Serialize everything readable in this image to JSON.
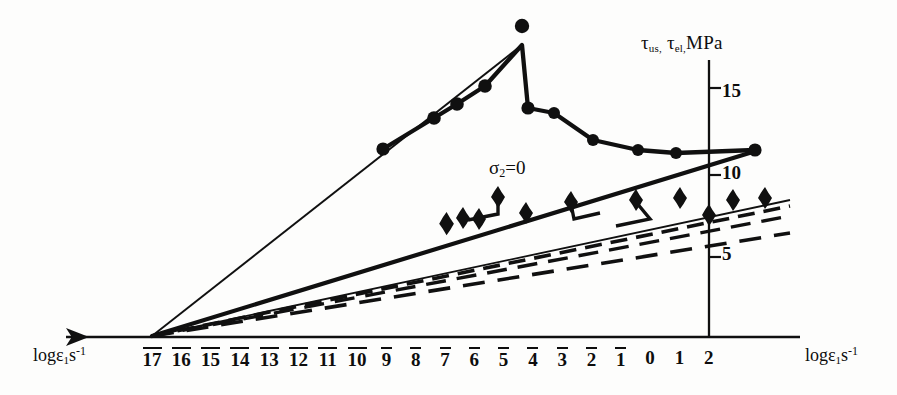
{
  "chart_data": {
    "type": "line",
    "title": "",
    "xlabel": "logε̇1 s⁻¹",
    "ylabel": "τus, τel, MPa",
    "xlim": [
      -18.2,
      3.0
    ],
    "ylim": [
      0,
      17.6
    ],
    "grid": false,
    "legend": "none",
    "x_tick_labels": [
      "17",
      "16",
      "15",
      "14",
      "13",
      "12",
      "11",
      "10",
      "9",
      "8",
      "7",
      "6",
      "5",
      "4",
      "3",
      "2",
      "1",
      "0",
      "1",
      "2"
    ],
    "x_tick_values": [
      -17,
      -16,
      -15,
      -14,
      -13,
      -12,
      -11,
      -10,
      -9,
      -8,
      -7,
      -6,
      -5,
      -4,
      -3,
      -2,
      -1,
      0,
      1,
      2
    ],
    "x_tick_negative": [
      true,
      true,
      true,
      true,
      true,
      true,
      true,
      true,
      true,
      true,
      true,
      true,
      true,
      true,
      true,
      true,
      true,
      false,
      false,
      false
    ],
    "y_tick_labels": [
      "5",
      "10",
      "15"
    ],
    "y_tick_values": [
      5,
      10,
      15
    ],
    "origin_x": -17,
    "origin_y": 0,
    "annotations": [
      {
        "text": "σ₂=0",
        "x": -4.6,
        "y": 10.9
      }
    ],
    "series": [
      {
        "name": "ultimate-shear-strength-circles",
        "marker": "filled-circle",
        "line": "solid-thick",
        "points": [
          {
            "x": -9.6,
            "y": 11.2
          },
          {
            "x": -8.0,
            "y": 13.1
          },
          {
            "x": -7.3,
            "y": 13.9
          },
          {
            "x": -6.4,
            "y": 15.0
          },
          {
            "x": -5.2,
            "y": 17.4
          },
          {
            "x": -5.0,
            "y": 13.6
          },
          {
            "x": -4.2,
            "y": 13.3
          },
          {
            "x": -3.0,
            "y": 11.7
          },
          {
            "x": -1.6,
            "y": 11.1
          },
          {
            "x": -0.4,
            "y": 10.9
          },
          {
            "x": 1.5,
            "y": 11.1
          }
        ]
      },
      {
        "name": "elastic-limit-stars-upper",
        "marker": "four-point-star",
        "line": "solid-thin",
        "points": [
          {
            "x": -8.1,
            "y": 7.1
          },
          {
            "x": -7.0,
            "y": 7.3
          },
          {
            "x": -6.6,
            "y": 7.3
          },
          {
            "x": -5.6,
            "y": 8.3
          },
          {
            "x": -4.9,
            "y": 7.5
          },
          {
            "x": -4.1,
            "y": 8.1
          },
          {
            "x": -3.4,
            "y": 7.9
          },
          {
            "x": -2.6,
            "y": 8.2
          },
          {
            "x": -1.4,
            "y": 8.1
          },
          {
            "x": -0.1,
            "y": 7.5
          },
          {
            "x": 0.6,
            "y": 8.0
          },
          {
            "x": 1.4,
            "y": 8.1
          }
        ]
      }
    ],
    "fan_lines": [
      {
        "name": "upper-envelope-thin",
        "style": "solid-thin",
        "from": {
          "x": -17,
          "y": 0
        },
        "to": {
          "x": -5.2,
          "y": 17.4
        }
      },
      {
        "name": "sigma2-zero-line",
        "style": "solid-thick",
        "from": {
          "x": -17,
          "y": 0
        },
        "to": {
          "x": 1.5,
          "y": 11.1
        }
      },
      {
        "name": "star-band-solid",
        "style": "solid-thin",
        "from": {
          "x": -17,
          "y": 0
        },
        "to": {
          "x": 2.0,
          "y": 8.3
        }
      },
      {
        "name": "star-band-dashed-upper",
        "style": "dashed",
        "from": {
          "x": -17,
          "y": 0
        },
        "to": {
          "x": 2.0,
          "y": 8.0
        }
      },
      {
        "name": "star-band-dashed-mid",
        "style": "dashed",
        "from": {
          "x": -17,
          "y": 0
        },
        "to": {
          "x": 2.0,
          "y": 7.4
        }
      },
      {
        "name": "lower-dashed-line",
        "style": "dashed",
        "from": {
          "x": -17,
          "y": 0
        },
        "to": {
          "x": 2.0,
          "y": 6.4
        }
      }
    ]
  },
  "axis": {
    "x_label_left": "logε",
    "x_label_left_sub": "1",
    "x_label_left_unit": "s",
    "x_label_left_sup": "-1",
    "x_label_right": "logε",
    "x_label_right_sub": "1",
    "x_label_right_unit": "s",
    "x_label_right_sup": "-1",
    "y_label_tau1": "τ",
    "y_label_tau1_sub": "us,",
    "y_label_tau2": "τ",
    "y_label_tau2_sub": "el,",
    "y_label_unit": "MPa"
  },
  "annotation": {
    "sigma_text": "σ",
    "sigma_sub": "2",
    "sigma_eq": "=0"
  }
}
